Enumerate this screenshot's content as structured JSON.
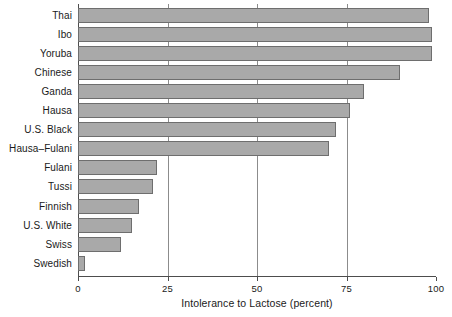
{
  "chart_data": {
    "type": "bar",
    "orientation": "horizontal",
    "title": "",
    "xlabel": "Intolerance to Lactose (percent)",
    "ylabel": "",
    "xlim": [
      0,
      100
    ],
    "xticks": [
      0,
      25,
      50,
      75,
      100
    ],
    "xtick_labels": [
      "0",
      "25",
      "50",
      "75",
      "100"
    ],
    "grid": "vertical gridlines at 25, 50, 75",
    "legend": "none",
    "bar_fill_color": "#a9a9a9",
    "bar_edge_color": "#6e6e6e",
    "axis_color": "#4d4d4d",
    "gridline_color": "#8c8c8c",
    "background_color": "#ffffff",
    "categories": [
      "Thai",
      "Ibo",
      "Yoruba",
      "Chinese",
      "Ganda",
      "Hausa",
      "U.S. Black",
      "Hausa–Fulani",
      "Fulani",
      "Tussi",
      "Finnish",
      "U.S. White",
      "Swiss",
      "Swedish"
    ],
    "values": [
      98,
      99,
      99,
      90,
      80,
      76,
      72,
      70,
      22,
      21,
      17,
      15,
      12,
      2
    ]
  }
}
